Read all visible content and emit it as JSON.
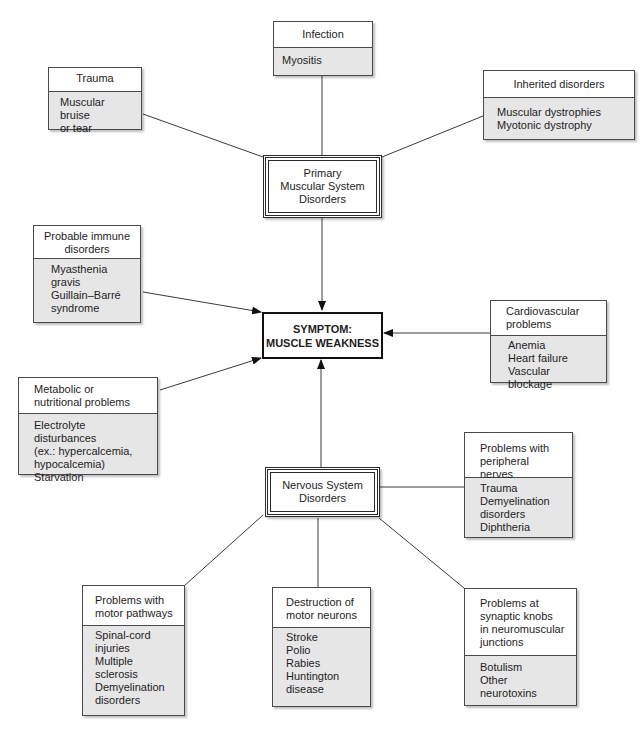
{
  "center": {
    "symptom": "SYMPTOM:\nMUSCLE WEAKNESS",
    "primary_muscular": "Primary\nMuscular System\nDisorders",
    "nervous_system": "Nervous System\nDisorders"
  },
  "muscular_causes": {
    "trauma": {
      "title": "Trauma",
      "items": "Muscular bruise\n  or tear"
    },
    "infection": {
      "title": "Infection",
      "items": "Myositis"
    },
    "inherited": {
      "title": "Inherited disorders",
      "items": "Muscular dystrophies\nMyotonic dystrophy"
    }
  },
  "direct_causes": {
    "immune": {
      "title": "Probable immune\ndisorders",
      "items": "Myasthenia\n  gravis\nGuillain–Barré\n  syndrome"
    },
    "metabolic": {
      "title": "Metabolic or\nnutritional problems",
      "items": "Electrolyte disturbances\n  (ex.: hypercalcemia,\n  hypocalcemia)\nStarvation"
    },
    "cardiovascular": {
      "title": "Cardiovascular\n   problems",
      "items": "Anemia\nHeart failure\nVascular blockage"
    }
  },
  "nervous_causes": {
    "peripheral": {
      "title": "Problems with\nperipheral nerves",
      "items": "Trauma\nDemyelination\n  disorders\nDiphtheria"
    },
    "motor_pathways": {
      "title": "Problems with\nmotor pathways",
      "items": "Spinal-cord\n  injuries\nMultiple\n  sclerosis\nDemyelination\n  disorders"
    },
    "motor_neurons": {
      "title": "Destruction of\nmotor neurons",
      "items": "Stroke\nPolio\nRabies\nHuntington\n  disease"
    },
    "synaptic": {
      "title": "Problems at\nsynaptic knobs\nin neuromuscular\njunctions",
      "items": "Botulism\nOther neurotoxins"
    }
  },
  "colors": {
    "line": "#3a3a3a",
    "box_body": "#e6e6e6",
    "border": "#4a4a4a"
  }
}
